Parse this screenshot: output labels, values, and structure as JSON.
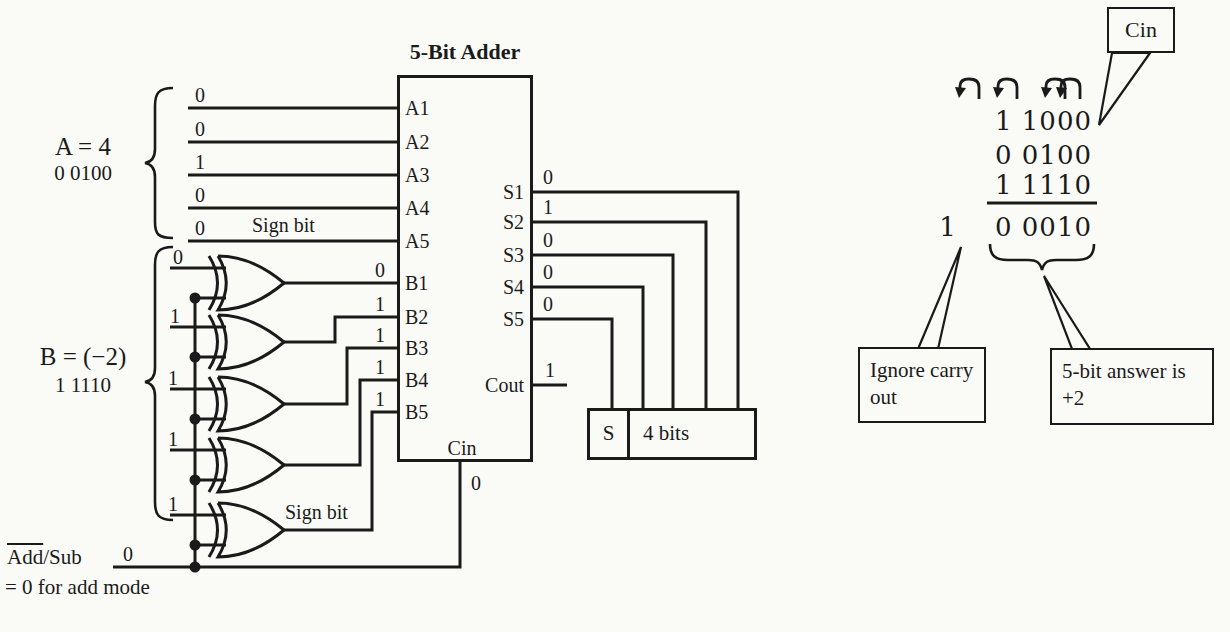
{
  "colors": {
    "ink": "#1a1a1a",
    "paper": "#fafaf7"
  },
  "figure": {
    "adder": {
      "title": "5-Bit Adder",
      "a_ports": [
        "A1",
        "A2",
        "A3",
        "A4",
        "A5"
      ],
      "b_ports": [
        "B1",
        "B2",
        "B3",
        "B4",
        "B5"
      ],
      "s_ports": [
        "S1",
        "S2",
        "S3",
        "S4",
        "S5"
      ],
      "cout_label": "Cout",
      "cin_label": "Cin"
    },
    "input_a": {
      "label": "A = 4",
      "binary": "0 0100",
      "bits": [
        "0",
        "0",
        "1",
        "0",
        "0"
      ],
      "sign_bit_label": "Sign bit"
    },
    "input_b": {
      "label": "B = (−2)",
      "binary": "1 1110",
      "bits": [
        "0",
        "1",
        "1",
        "1",
        "1"
      ],
      "xor_outputs": [
        "0",
        "1",
        "1",
        "1",
        "1"
      ],
      "sign_bit_label": "Sign bit"
    },
    "outputs": {
      "s_values": [
        "0",
        "1",
        "0",
        "0",
        "0"
      ],
      "cout_value": "1",
      "cin_value": "0"
    },
    "addsub": {
      "label_overline": "Add",
      "label_rest": "/Sub",
      "value": "0",
      "note": "= 0 for add mode"
    },
    "result_box": {
      "sign": "S",
      "bits": "4 bits"
    }
  },
  "worked_example": {
    "cin_callout": "Cin",
    "carry_row": "1 1000",
    "operand_a": "0 0100",
    "operand_b": "1 1110",
    "carry_out": "1",
    "result": "0 0010",
    "ignore_note": "Ignore carry out",
    "answer_note": "5-bit answer is +2"
  }
}
